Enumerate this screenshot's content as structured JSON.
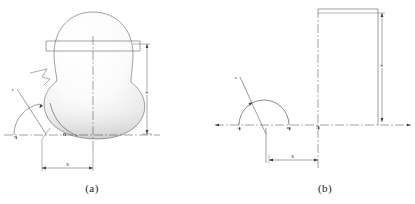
{
  "figure": {
    "panels": [
      {
        "id": "a",
        "caption": "(a)",
        "description": "shaded three-dimensional rendering of spheroidal vessel body with neck flange",
        "labels": {
          "height_dim": "H",
          "width_dim": "B",
          "angle_dim": "a",
          "axis_node": "O",
          "base_node": "A"
        }
      },
      {
        "id": "b",
        "caption": "(b)",
        "description": "two-dimensional schematic outline with semicircular arc and centerlines",
        "labels": {
          "height_dim": "H",
          "width_dim": "B",
          "angle_dim": "a",
          "left_node": "C",
          "mid_node": "A",
          "axis_node": "O"
        }
      }
    ],
    "colors": {
      "line": "#3c3c3c",
      "centerline": "#2e2e2e",
      "shade_dark": "#4a4a4a",
      "shade_light": "#f2f2f2",
      "text": "#1a1a1a"
    }
  }
}
